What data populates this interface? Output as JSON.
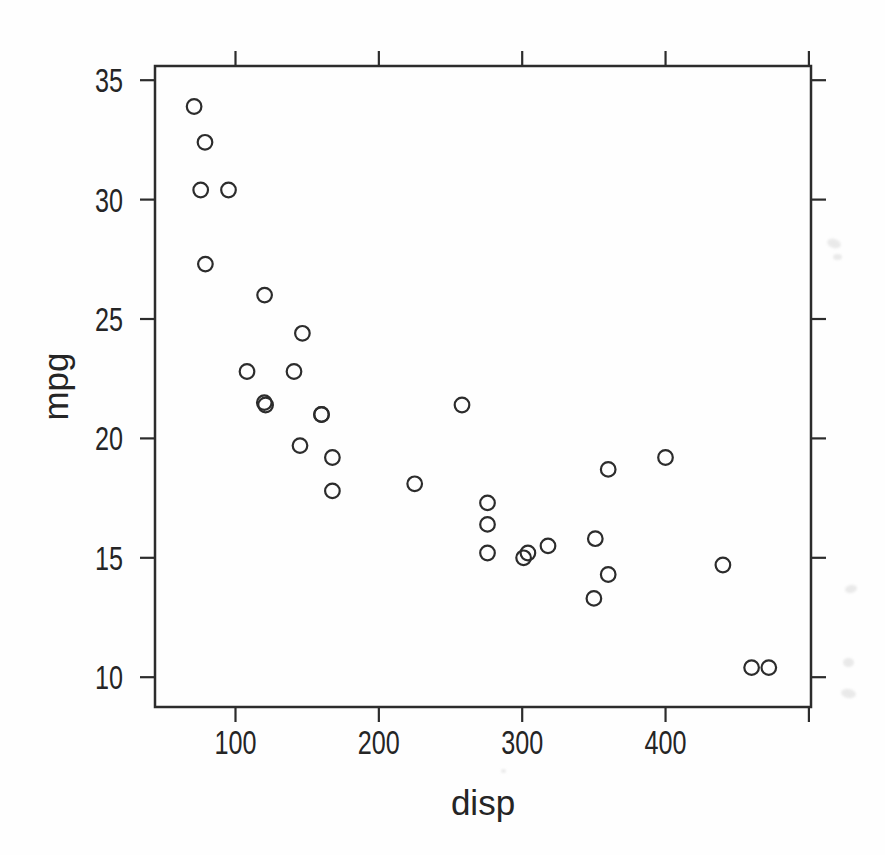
{
  "style": {
    "ink_color": "#2c2c2c",
    "background": "#fefefe"
  },
  "chart_data": {
    "type": "scatter",
    "title": "",
    "marker": "open-circle",
    "grid": false,
    "legend": null,
    "x_axis": {
      "title": "disp",
      "range": [
        44,
        500
      ],
      "ticks": [
        100,
        200,
        300,
        400,
        500
      ],
      "tick_labels": [
        "100",
        "200",
        "300",
        "400",
        null
      ],
      "tick_sides": [
        "bottom",
        "top"
      ]
    },
    "y_axis": {
      "title": "mpg",
      "range": [
        8.8,
        35.5
      ],
      "ticks": [
        10,
        15,
        20,
        25,
        30,
        35
      ],
      "tick_labels": [
        "10",
        "15",
        "20",
        "25",
        "30",
        "35"
      ],
      "tick_sides": [
        "left",
        "right"
      ]
    },
    "points": [
      [
        160.0,
        21.0
      ],
      [
        160.0,
        21.0
      ],
      [
        108.0,
        22.8
      ],
      [
        258.0,
        21.4
      ],
      [
        360.0,
        18.7
      ],
      [
        225.0,
        18.1
      ],
      [
        360.0,
        14.3
      ],
      [
        146.7,
        24.4
      ],
      [
        140.8,
        22.8
      ],
      [
        167.6,
        19.2
      ],
      [
        167.6,
        17.8
      ],
      [
        275.8,
        16.4
      ],
      [
        275.8,
        17.3
      ],
      [
        275.8,
        15.2
      ],
      [
        472.0,
        10.4
      ],
      [
        460.0,
        10.4
      ],
      [
        440.0,
        14.7
      ],
      [
        78.7,
        32.4
      ],
      [
        75.7,
        30.4
      ],
      [
        71.1,
        33.9
      ],
      [
        120.1,
        21.5
      ],
      [
        318.0,
        15.5
      ],
      [
        304.0,
        15.2
      ],
      [
        350.0,
        13.3
      ],
      [
        400.0,
        19.2
      ],
      [
        79.0,
        27.3
      ],
      [
        120.3,
        26.0
      ],
      [
        95.1,
        30.4
      ],
      [
        351.0,
        15.8
      ],
      [
        145.0,
        19.7
      ],
      [
        301.0,
        15.0
      ],
      [
        121.0,
        21.4
      ]
    ]
  }
}
